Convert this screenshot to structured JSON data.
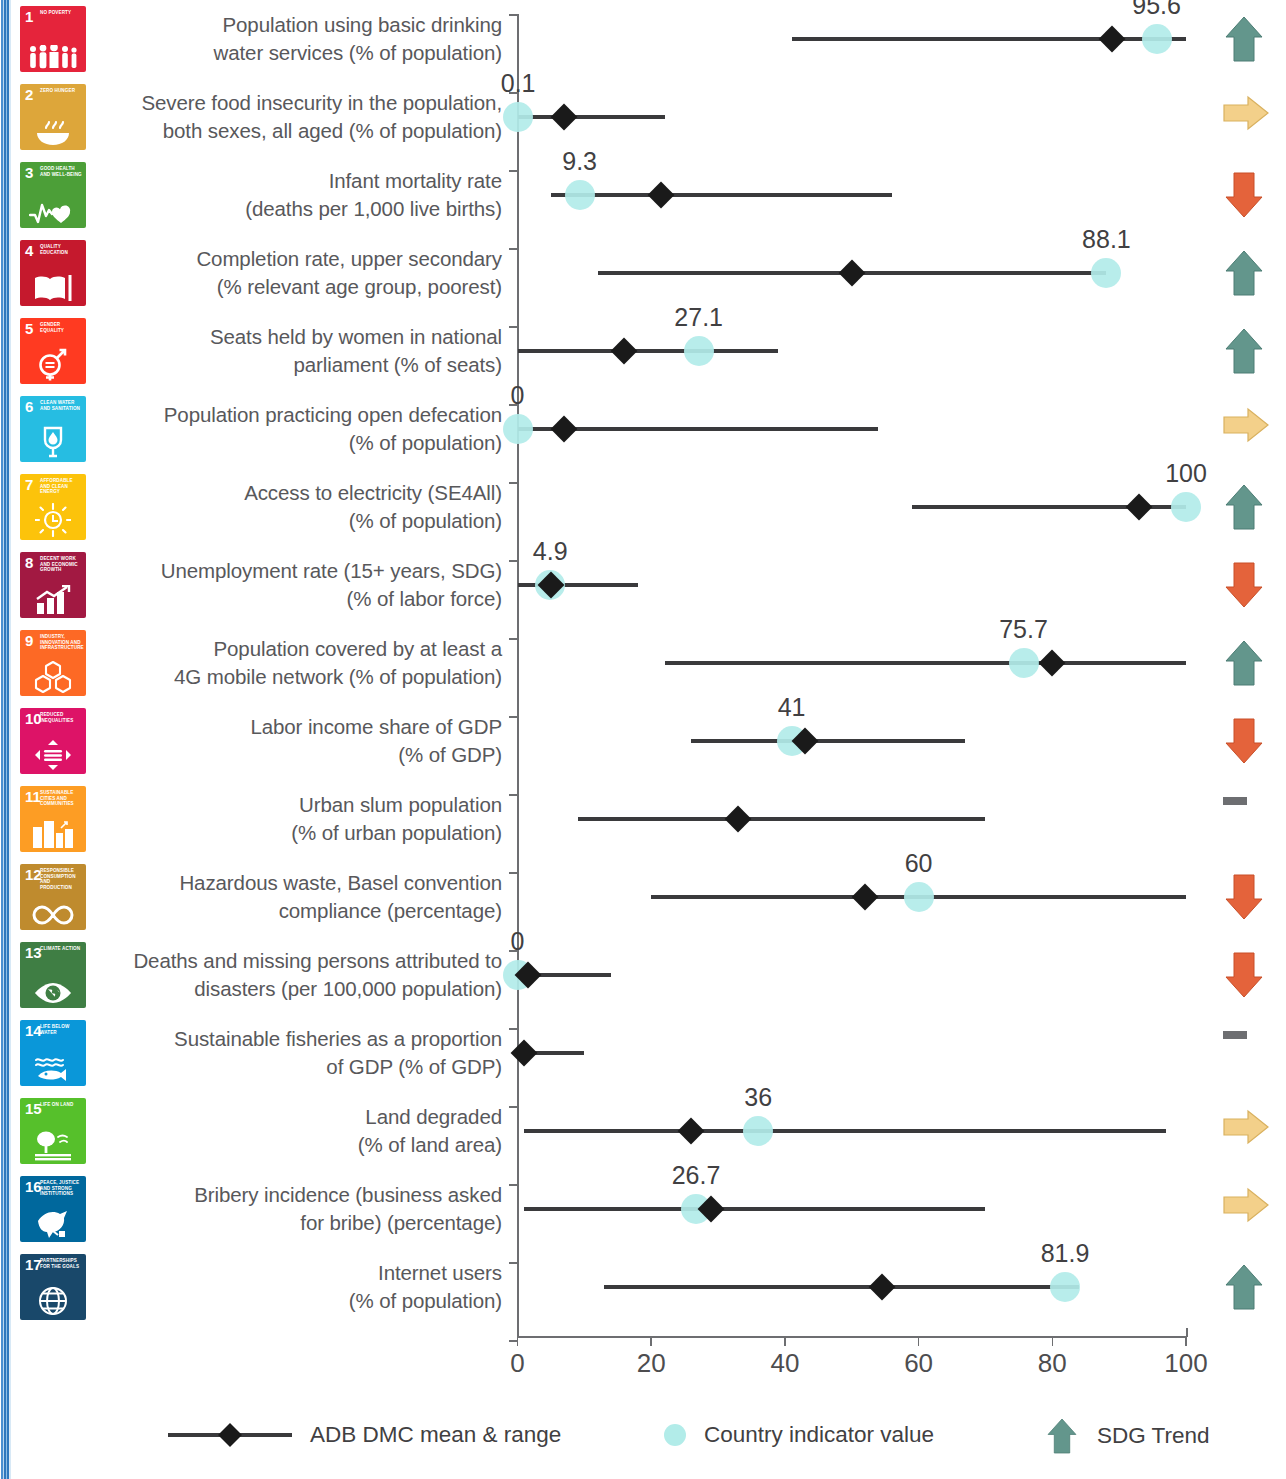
{
  "chart_data": {
    "type": "table",
    "title": "",
    "xlabel": "",
    "ylabel": "",
    "xlim": [
      0,
      100
    ],
    "x_ticks": [
      "0",
      "20",
      "40",
      "60",
      "80",
      "100"
    ],
    "grid": false,
    "legend_position": "bottom",
    "series": [
      {
        "name": "ADB DMC mean & range",
        "type": "range-with-mean"
      },
      {
        "name": "Country indicator value",
        "type": "point"
      },
      {
        "name": "SDG Trend",
        "type": "arrow"
      }
    ],
    "rows": [
      {
        "goal": 1,
        "goal_title": "NO POVERTY",
        "goal_color": "#e5243b",
        "goal_icon": "people-icon",
        "label_lines": [
          "Population using basic drinking",
          "water services (% of population)"
        ],
        "range_min": 41,
        "range_max": 100,
        "mean": 89,
        "country_value": 95.6,
        "country_value_label": "95.6",
        "trend": "up"
      },
      {
        "goal": 2,
        "goal_title": "ZERO HUNGER",
        "goal_color": "#dda63a",
        "goal_icon": "bowl-icon",
        "label_lines": [
          "Severe food insecurity in the population,",
          "both sexes, all aged (% of population)"
        ],
        "range_min": 0,
        "range_max": 22,
        "mean": 7,
        "country_value": 0.1,
        "country_value_label": "0.1",
        "trend": "flat-right"
      },
      {
        "goal": 3,
        "goal_title": "GOOD HEALTH AND WELL-BEING",
        "goal_color": "#4c9f38",
        "goal_icon": "heartbeat-icon",
        "label_lines": [
          "Infant mortality rate",
          "(deaths per 1,000 live births)"
        ],
        "range_min": 5,
        "range_max": 56,
        "mean": 21.5,
        "country_value": 9.3,
        "country_value_label": "9.3",
        "trend": "down"
      },
      {
        "goal": 4,
        "goal_title": "QUALITY EDUCATION",
        "goal_color": "#c5192d",
        "goal_icon": "book-icon",
        "label_lines": [
          "Completion rate, upper secondary",
          "(% relevant age group, poorest)"
        ],
        "range_min": 12,
        "range_max": 88,
        "mean": 50,
        "country_value": 88.1,
        "country_value_label": "88.1",
        "trend": "up"
      },
      {
        "goal": 5,
        "goal_title": "GENDER EQUALITY",
        "goal_color": "#ff3a21",
        "goal_icon": "gender-equality-icon",
        "label_lines": [
          "Seats held by women in national",
          "parliament (% of seats)"
        ],
        "range_min": 0,
        "range_max": 39,
        "mean": 16,
        "country_value": 27.1,
        "country_value_label": "27.1",
        "trend": "up"
      },
      {
        "goal": 6,
        "goal_title": "CLEAN WATER AND SANITATION",
        "goal_color": "#26bde2",
        "goal_icon": "water-drop-icon",
        "label_lines": [
          "Population practicing open defecation",
          "(% of population)"
        ],
        "range_min": 0,
        "range_max": 54,
        "mean": 7,
        "country_value": 0,
        "country_value_label": "0",
        "trend": "flat-right"
      },
      {
        "goal": 7,
        "goal_title": "AFFORDABLE AND CLEAN ENERGY",
        "goal_color": "#fcc30b",
        "goal_icon": "sun-icon",
        "label_lines": [
          "Access to electricity (SE4All)",
          "(% of population)"
        ],
        "range_min": 59,
        "range_max": 100,
        "mean": 93,
        "country_value": 100,
        "country_value_label": "100",
        "trend": "up"
      },
      {
        "goal": 8,
        "goal_title": "DECENT WORK AND ECONOMIC GROWTH",
        "goal_color": "#a21942",
        "goal_icon": "bar-growth-icon",
        "label_lines": [
          "Unemployment rate (15+ years, SDG)",
          "(% of labor force)"
        ],
        "range_min": 0,
        "range_max": 18,
        "mean": 5,
        "country_value": 4.9,
        "country_value_label": "4.9",
        "trend": "down"
      },
      {
        "goal": 9,
        "goal_title": "INDUSTRY, INNOVATION AND INFRASTRUCTURE",
        "goal_color": "#fd6925",
        "goal_icon": "cubes-icon",
        "label_lines": [
          "Population covered by at least a",
          "4G mobile network (% of population)"
        ],
        "range_min": 22,
        "range_max": 100,
        "mean": 80,
        "country_value": 75.7,
        "country_value_label": "75.7",
        "trend": "up"
      },
      {
        "goal": 10,
        "goal_title": "REDUCED INEQUALITIES",
        "goal_color": "#dd1367",
        "goal_icon": "four-arrows-icon",
        "label_lines": [
          "Labor income share of GDP",
          "(% of GDP)"
        ],
        "range_min": 26,
        "range_max": 67,
        "mean": 43,
        "country_value": 41,
        "country_value_label": "41",
        "trend": "down"
      },
      {
        "goal": 11,
        "goal_title": "SUSTAINABLE CITIES AND COMMUNITIES",
        "goal_color": "#fd9d24",
        "goal_icon": "city-icon",
        "label_lines": [
          "Urban slum population",
          "(% of urban population)"
        ],
        "range_min": 9,
        "range_max": 70,
        "mean": 33,
        "country_value": null,
        "country_value_label": "",
        "trend": "no-data"
      },
      {
        "goal": 12,
        "goal_title": "RESPONSIBLE CONSUMPTION AND PRODUCTION",
        "goal_color": "#bf8b2e",
        "goal_icon": "infinity-icon",
        "label_lines": [
          "Hazardous waste, Basel convention",
          "compliance (percentage)"
        ],
        "range_min": 20,
        "range_max": 100,
        "mean": 52,
        "country_value": 60,
        "country_value_label": "60",
        "trend": "down"
      },
      {
        "goal": 13,
        "goal_title": "CLIMATE ACTION",
        "goal_color": "#3f7e44",
        "goal_icon": "eye-earth-icon",
        "label_lines": [
          "Deaths and missing persons attributed to",
          "disasters (per 100,000 population)"
        ],
        "range_min": 0,
        "range_max": 14,
        "mean": 1.5,
        "country_value": 0,
        "country_value_label": "0",
        "trend": "down"
      },
      {
        "goal": 14,
        "goal_title": "LIFE BELOW WATER",
        "goal_color": "#0a97d9",
        "goal_icon": "fish-icon",
        "label_lines": [
          "Sustainable fisheries as a proportion",
          "of GDP (% of GDP)"
        ],
        "range_min": 0,
        "range_max": 10,
        "mean": 1,
        "country_value": null,
        "country_value_label": "",
        "trend": "no-data"
      },
      {
        "goal": 15,
        "goal_title": "LIFE ON LAND",
        "goal_color": "#56c02b",
        "goal_icon": "tree-icon",
        "label_lines": [
          "Land degraded",
          "(% of land area)"
        ],
        "range_min": 1,
        "range_max": 97,
        "mean": 26,
        "country_value": 36,
        "country_value_label": "36",
        "trend": "flat-right"
      },
      {
        "goal": 16,
        "goal_title": "PEACE, JUSTICE AND STRONG INSTITUTIONS",
        "goal_color": "#00689d",
        "goal_icon": "dove-icon",
        "label_lines": [
          "Bribery incidence (business asked",
          "for bribe) (percentage)"
        ],
        "range_min": 1,
        "range_max": 70,
        "mean": 29,
        "country_value": 26.7,
        "country_value_label": "26.7",
        "trend": "flat-right"
      },
      {
        "goal": 17,
        "goal_title": "PARTNERSHIPS FOR THE GOALS",
        "goal_color": "#19486a",
        "goal_icon": "circle-globe-icon",
        "label_lines": [
          "Internet users",
          "(% of population)"
        ],
        "range_min": 13,
        "range_max": 84,
        "mean": 54.5,
        "country_value": 81.9,
        "country_value_label": "81.9",
        "trend": "up"
      }
    ]
  },
  "legend": {
    "range_label": "ADB DMC mean & range",
    "country_label": "Country indicator value",
    "trend_label": "SDG Trend"
  },
  "colors": {
    "country_dot": "#b2ece9",
    "mean_diamond": "#1a1a1a",
    "range_line": "#3a3a3c",
    "trend_up": "#63968c",
    "trend_down": "#e4633b",
    "trend_flat": "#f3d08a",
    "trend_nodata": "#6d6e71",
    "axis": "#6d6e71",
    "label_text": "#58585b"
  }
}
